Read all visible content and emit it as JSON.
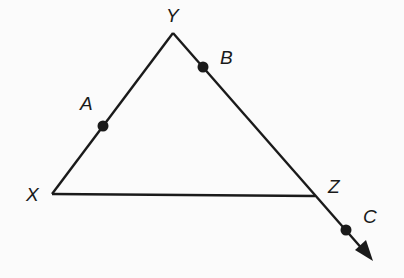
{
  "diagram": {
    "type": "triangle-with-extended-ray",
    "colors": {
      "stroke": "#1a1a1a",
      "background": "#fbfbfb"
    },
    "vertices": [
      {
        "name": "X",
        "x": 52,
        "y": 194,
        "label_x": 26,
        "label_y": 201
      },
      {
        "name": "Y",
        "x": 173,
        "y": 33,
        "label_x": 166,
        "label_y": 22
      },
      {
        "name": "Z",
        "x": 315,
        "y": 196,
        "label_x": 328,
        "label_y": 193
      }
    ],
    "points": [
      {
        "name": "A",
        "x": 103,
        "y": 126,
        "on_segment": "XY",
        "label_x": 80,
        "label_y": 110
      },
      {
        "name": "B",
        "x": 203,
        "y": 67,
        "on_segment": "YZ",
        "label_x": 220,
        "label_y": 64
      },
      {
        "name": "C",
        "x": 346,
        "y": 230,
        "on_ray": "YZ",
        "label_x": 363,
        "label_y": 223
      }
    ],
    "segments": [
      "XY",
      "YZ",
      "XZ"
    ],
    "ray": {
      "from": "Y",
      "through": "Z",
      "beyond": "C",
      "arrow_tip_x": 373,
      "arrow_tip_y": 261
    }
  }
}
